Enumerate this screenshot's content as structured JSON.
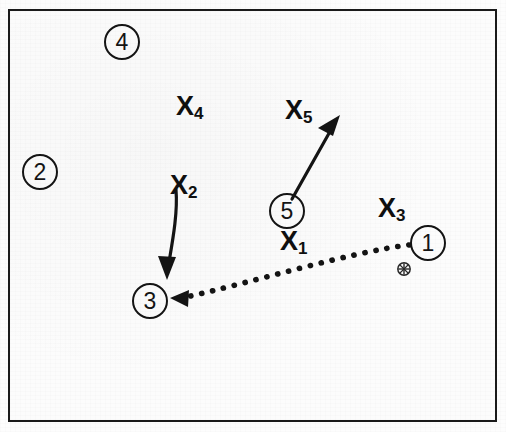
{
  "diagram": {
    "type": "sports-play-diagram",
    "background_color": "#fcfcfc",
    "stroke_color": "#141414",
    "frame": {
      "x": 8,
      "y": 9,
      "width": 489,
      "height": 413,
      "border_width": 2
    },
    "players": [
      {
        "id": "player-1",
        "label": "1",
        "cx": 428,
        "cy": 243,
        "r": 18
      },
      {
        "id": "player-2",
        "label": "2",
        "cx": 40,
        "cy": 172,
        "r": 18
      },
      {
        "id": "player-3",
        "label": "3",
        "cx": 150,
        "cy": 301,
        "r": 18
      },
      {
        "id": "player-4",
        "label": "4",
        "cx": 122,
        "cy": 42,
        "r": 18
      },
      {
        "id": "player-5",
        "label": "5",
        "cx": 287,
        "cy": 211,
        "r": 18
      }
    ],
    "x_markers": [
      {
        "id": "x-marker-1",
        "base": "X",
        "sub": "1",
        "x": 280,
        "y": 228
      },
      {
        "id": "x-marker-2",
        "base": "X",
        "sub": "2",
        "x": 170,
        "y": 172
      },
      {
        "id": "x-marker-3",
        "base": "X",
        "sub": "3",
        "x": 378,
        "y": 195
      },
      {
        "id": "x-marker-4",
        "base": "X",
        "sub": "4",
        "x": 176,
        "y": 93
      },
      {
        "id": "x-marker-5",
        "base": "X",
        "sub": "5",
        "x": 285,
        "y": 97
      }
    ],
    "ball": {
      "id": "ball-symbol",
      "cx": 404,
      "cy": 269,
      "r": 6
    },
    "arrows": [
      {
        "id": "cut-arrow-x2",
        "style": "solid",
        "description": "solid arrow from X2 curving down to player 3",
        "from": [
          176,
          190
        ],
        "to": [
          167,
          277
        ]
      },
      {
        "id": "cut-arrow-player5",
        "style": "solid",
        "description": "solid arrow from player 5 up-right toward X5",
        "from": [
          292,
          199
        ],
        "to": [
          340,
          116
        ]
      },
      {
        "id": "pass-arrow-1-to-3",
        "style": "dotted",
        "description": "dotted pass arrow from player 1 to player 3",
        "from": [
          410,
          245
        ],
        "to": [
          172,
          298
        ]
      }
    ]
  }
}
